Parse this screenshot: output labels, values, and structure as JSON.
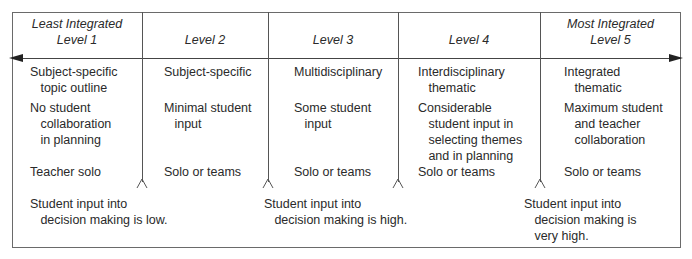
{
  "levels": [
    {
      "header_line1": "Least Integrated",
      "header_line2": "Level 1",
      "content": "Subject-specific\n   topic outline",
      "input": "No student\n   collaboration\n   in planning",
      "teaching": "Teacher solo"
    },
    {
      "header_line1": "",
      "header_line2": "Level 2",
      "content": "Subject-specific",
      "input": "Minimal student\n   input",
      "teaching": "Solo or teams"
    },
    {
      "header_line1": "",
      "header_line2": "Level 3",
      "content": "Multidisciplinary",
      "input": "Some student\n   input",
      "teaching": "Solo or teams"
    },
    {
      "header_line1": "",
      "header_line2": "Level 4",
      "content": "Interdisciplinary\n   thematic",
      "input": "Considerable\n   student input in\n   selecting themes\n   and in planning",
      "teaching": "Solo or teams"
    },
    {
      "header_line1": "Most Integrated",
      "header_line2": "Level 5",
      "content": "Integrated\n   thematic",
      "input": "Maximum student\n   and teacher\n   collaboration",
      "teaching": "Solo or teams"
    }
  ],
  "notes": [
    {
      "text": "Student input into\n   decision making is low."
    },
    {
      "text": "Student input into\n   decision making is high."
    },
    {
      "text": "Student input into\n   decision making is\n   very high."
    }
  ],
  "colors": {
    "line": "#555555",
    "text": "#2a2a2a",
    "arrow": "#222222"
  }
}
